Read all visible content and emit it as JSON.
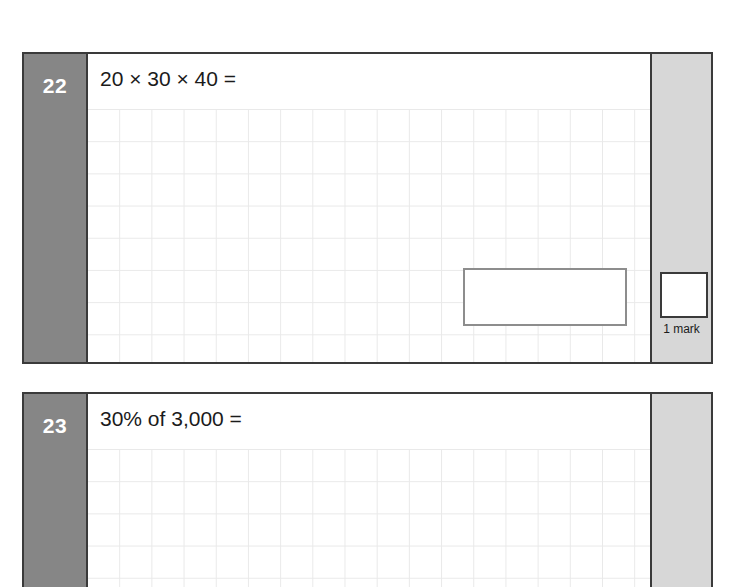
{
  "document": {
    "type": "maths-test-paper",
    "page_background": "#ffffff",
    "colors": {
      "question_number_column": "#868686",
      "marks_column": "#d7d7d7",
      "block_border": "#3a3a3a",
      "grid_line": "#e9e9e9",
      "answer_box_border": "#8d8d8d",
      "text": "#1b1b1b",
      "question_number_text": "#ffffff"
    }
  },
  "questions": [
    {
      "number": "22",
      "text": "20 × 30 × 40 =",
      "has_answer_box": true,
      "answer_box_value": "",
      "marks_label": "1 mark",
      "marks_box_value": ""
    },
    {
      "number": "23",
      "text": "30% of 3,000 =",
      "has_answer_box": false,
      "answer_box_value": "",
      "marks_label": "",
      "marks_box_value": ""
    }
  ]
}
